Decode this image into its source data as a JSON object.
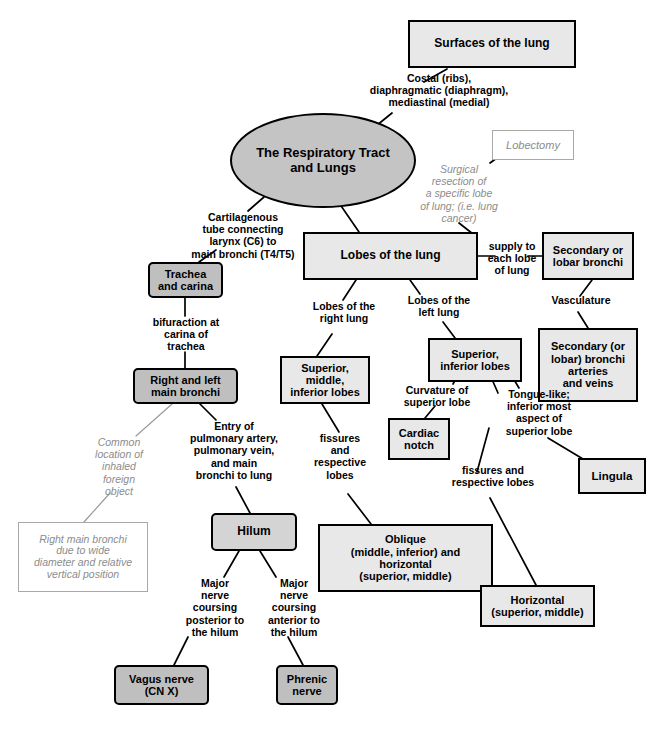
{
  "diagram": {
    "colors": {
      "root_fill": "#c4c4c4",
      "concept_fill_light": "#e8e8e8",
      "concept_fill_dark": "#bfbfbf",
      "note_text": "#8c8c8c",
      "border": "#000000",
      "note_border": "#a8a8a8",
      "background": "#ffffff"
    },
    "nodes": {
      "root": "The Respiratory Tract\nand Lungs",
      "surfaces_of_lung": "Surfaces of the lung",
      "lobectomy": "Lobectomy",
      "lobes_of_lung": "Lobes of the lung",
      "trachea_carina": "Trachea\nand carina",
      "right_left_main_bronchi": "Right and left\nmain bronchi",
      "secondary_lobar_bronchi": "Secondary or\nlobar bronchi",
      "secondary_bronchi_vessels": "Secondary (or\nlobar) bronchi\narteries\nand veins",
      "right_lung_lobes": "Superior,\nmiddle,\ninferior lobes",
      "left_lung_lobes": "Superior,\ninferior lobes",
      "cardiac_notch": "Cardiac\nnotch",
      "lingula": "Lingula",
      "hilum": "Hilum",
      "oblique_horizontal": "Oblique\n(middle, inferior) and\nhorizontal\n(superior, middle)",
      "horizontal": "Horizontal\n(superior, middle)",
      "vagus_nerve": "Vagus nerve\n(CN X)",
      "phrenic_nerve": "Phrenic\nnerve",
      "foreign_object_note": "Right main bronchi\ndue to wide\ndiameter and relative\nvertical position"
    },
    "link_labels": {
      "surfaces_detail": "Costal (ribs),\ndiaphragmatic (diaphragm),\nmediastinal (medial)",
      "lobectomy_detail": "Surgical\nresection of\na specific lobe\nof lung; (i.e. lung\ncancer)",
      "trachea_detail": "Cartilagenous\ntube connecting\nlarynx (C6) to\nmain bronchi (T4/T5)",
      "bifurcation": "bifuraction at\ncarina of\ntrachea",
      "common_location": "Common\nlocation of\ninhaled\nforeign\nobject",
      "entry_of": "Entry of\npulmonary artery,\npulmonary vein,\nand main\nbronchi to lung",
      "supply_to_each_lobe": "supply to\neach lobe\nof lung",
      "vasculature": "Vasculature",
      "lobes_right_lung": "Lobes of the\nright lung",
      "lobes_left_lung": "Lobes of the\nleft lung",
      "curvature_superior": "Curvature of\nsuperior lobe",
      "tongue_like": "Tongue-like;\ninferior most\naspect of\nsuperior lobe",
      "fissures_left": "fissures\nand\nrespective\nlobes",
      "fissures_right": "fissures and\nrespective lobes",
      "nerve_posterior": "Major\nnerve\ncoursing\nposterior to\nthe hilum",
      "nerve_anterior": "Major\nnerve\ncoursing\nanterior to\nthe hilum"
    }
  }
}
